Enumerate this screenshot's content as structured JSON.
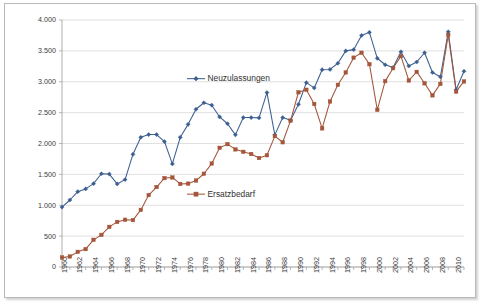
{
  "chart_data": {
    "type": "line",
    "title": "",
    "subtitle": "",
    "xlabel": "",
    "ylabel": "",
    "x": [
      1960,
      1961,
      1962,
      1963,
      1964,
      1965,
      1966,
      1967,
      1968,
      1969,
      1970,
      1971,
      1972,
      1973,
      1974,
      1975,
      1976,
      1977,
      1978,
      1979,
      1980,
      1981,
      1982,
      1983,
      1984,
      1985,
      1986,
      1987,
      1988,
      1989,
      1990,
      1991,
      1992,
      1993,
      1994,
      1995,
      1996,
      1997,
      1998,
      1999,
      2000,
      2001,
      2002,
      2003,
      2004,
      2005,
      2006,
      2007,
      2008,
      2009,
      2010,
      2011
    ],
    "xlim": [
      1960,
      2011
    ],
    "ylim": [
      0,
      4000
    ],
    "yticks": [
      0,
      500,
      1000,
      1500,
      2000,
      2500,
      3000,
      3500,
      4000
    ],
    "ytick_labels": [
      "0",
      "500",
      "1.000",
      "1.500",
      "2.000",
      "2.500",
      "3.000",
      "3.500",
      "4.000"
    ],
    "xtick_labels": [
      "1960",
      "1962",
      "1964",
      "1966",
      "1968",
      "1970",
      "1972",
      "1974",
      "1976",
      "1978",
      "1980",
      "1982",
      "1984",
      "1986",
      "1988",
      "1990",
      "1992",
      "1994",
      "1996",
      "1998",
      "2000",
      "2002",
      "2004",
      "2006",
      "2008",
      "2010"
    ],
    "xtick_values": [
      1960,
      1962,
      1964,
      1966,
      1968,
      1970,
      1972,
      1974,
      1976,
      1978,
      1980,
      1982,
      1984,
      1986,
      1988,
      1990,
      1992,
      1994,
      1996,
      1998,
      2000,
      2002,
      2004,
      2006,
      2008,
      2010
    ],
    "grid": "horizontal",
    "legend_position": "inline-annotations",
    "series": [
      {
        "name": "Neuzulassungen",
        "color": "#3c5f8f",
        "marker": "diamond",
        "label_x": 1977,
        "label_y": 3050,
        "values": [
          970,
          1085,
          1220,
          1265,
          1350,
          1510,
          1505,
          1345,
          1415,
          1825,
          2100,
          2145,
          2145,
          2030,
          1670,
          2100,
          2310,
          2555,
          2660,
          2620,
          2430,
          2320,
          2140,
          2420,
          2420,
          2415,
          2825,
          2140,
          2420,
          2375,
          2635,
          2985,
          2900,
          3195,
          3200,
          3300,
          3500,
          3520,
          3750,
          3800,
          3380,
          3275,
          3230,
          3485,
          3255,
          3320,
          3470,
          3150,
          3080,
          3810,
          2870,
          3170
        ]
      },
      {
        "name": "Ersatzbedarf",
        "color": "#a4563a",
        "marker": "square",
        "label_x": 1977,
        "label_y": 1180,
        "values": [
          155,
          170,
          245,
          290,
          440,
          520,
          650,
          730,
          765,
          760,
          925,
          1165,
          1295,
          1440,
          1450,
          1345,
          1350,
          1400,
          1510,
          1675,
          1930,
          1990,
          1905,
          1865,
          1830,
          1765,
          1810,
          2120,
          2020,
          2370,
          2830,
          2870,
          2640,
          2245,
          2680,
          2950,
          3150,
          3390,
          3470,
          3285,
          2545,
          3010,
          3220,
          3415,
          3020,
          3160,
          2975,
          2780,
          2965,
          3760,
          2840,
          3005
        ]
      }
    ]
  },
  "annotations": {
    "series1_label": "Neuzulassungen",
    "series2_label": "Ersatzbedarf"
  }
}
